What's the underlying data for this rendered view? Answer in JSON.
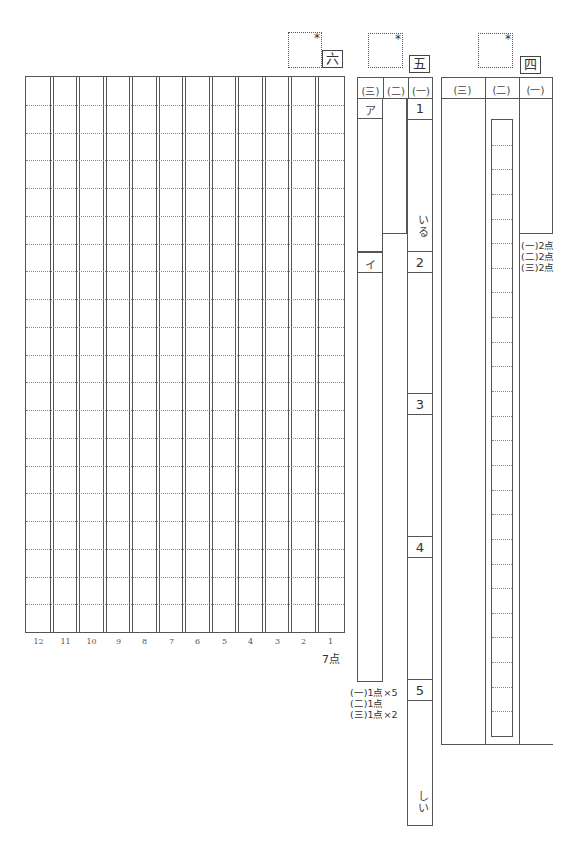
{
  "sections": {
    "roku": {
      "label": "六",
      "score_mark": "*",
      "score": "7点",
      "column_numbers": [
        "12",
        "11",
        "10",
        "9",
        "8",
        "7",
        "6",
        "5",
        "4",
        "3",
        "2",
        "1"
      ],
      "rows": 20
    },
    "go": {
      "label": "五",
      "score_mark": "*",
      "headers": [
        "(三)",
        "(二)",
        "(一)"
      ],
      "q3_items": [
        "ア",
        "イ"
      ],
      "q1_items": [
        "1",
        "2",
        "3",
        "4",
        "5"
      ],
      "q1_suffix_1": "いる",
      "q1_suffix_5": "しい",
      "scores": [
        "(一)1点×5",
        "(二)1点",
        "(三)1点×2"
      ]
    },
    "yon": {
      "label": "四",
      "score_mark": "*",
      "headers": [
        "(三)",
        "(二)",
        "(一)"
      ],
      "scores": [
        "(一)2点",
        "(二)2点",
        "(三)2点"
      ]
    }
  }
}
